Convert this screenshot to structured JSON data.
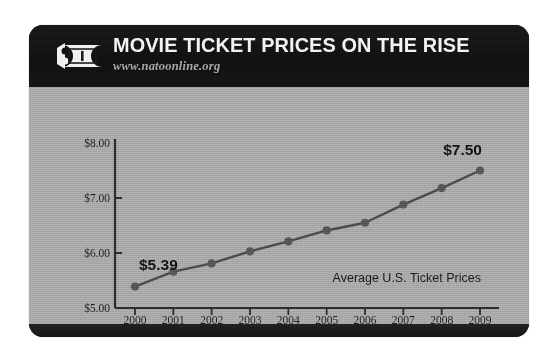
{
  "card": {
    "background_color": "#a8a8a8",
    "header_color": "#141414",
    "footer_color": "#1b1b1b"
  },
  "header": {
    "icon": "movie-ticket-icon",
    "title": "MOVIE TICKET PRICES ON THE RISE",
    "subtitle": "www.natoonline.org",
    "title_color": "#f2f2f2",
    "subtitle_color": "#a4a4a4"
  },
  "chart_data": {
    "type": "line",
    "title": "MOVIE TICKET PRICES ON THE RISE",
    "subtitle": "www.natoonline.org",
    "annotation": "Average U.S. Ticket Prices",
    "xlabel": "",
    "ylabel": "",
    "categories": [
      "2000",
      "2001",
      "2002",
      "2003",
      "2004",
      "2005",
      "2006",
      "2007",
      "2008",
      "2009"
    ],
    "values": [
      5.39,
      5.66,
      5.81,
      6.03,
      6.21,
      6.41,
      6.55,
      6.88,
      7.18,
      7.5
    ],
    "ylim": [
      5.0,
      8.0
    ],
    "ytick_labels": [
      "$8.00",
      "$7.00",
      "$6.00",
      "$5.00"
    ],
    "ytick_values": [
      8.0,
      7.0,
      6.0,
      5.0
    ],
    "grid": false,
    "legend": "none",
    "point_labels": [
      {
        "category": "2000",
        "value": 5.39,
        "text": "$5.39"
      },
      {
        "category": "2009",
        "value": 7.5,
        "text": "$7.50"
      }
    ],
    "series": [
      {
        "name": "Average U.S. Ticket Prices",
        "values": [
          5.39,
          5.66,
          5.81,
          6.03,
          6.21,
          6.41,
          6.55,
          6.88,
          7.18,
          7.5
        ],
        "line_color": "#4a4a4a",
        "marker_color": "#555555"
      }
    ]
  }
}
